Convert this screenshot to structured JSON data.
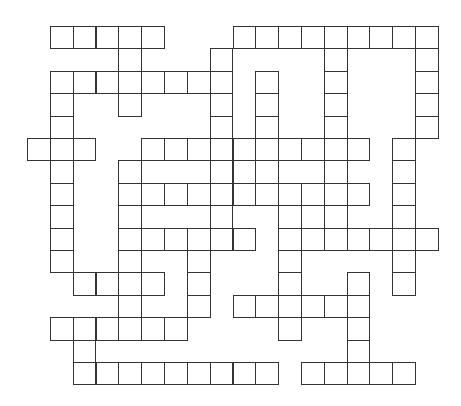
{
  "puzzle": {
    "type": "crossword-grid",
    "origin_x": 27,
    "origin_y": 26,
    "cell_w": 22.83,
    "cell_h": 22.4,
    "columns": 18,
    "rows": 16,
    "line_color": "#333333",
    "cell_color": "#ffffff",
    "cells_by_row": [
      [
        1,
        2,
        3,
        4,
        5,
        9,
        10,
        11,
        12,
        13,
        14,
        15,
        16,
        17
      ],
      [
        4,
        8,
        13,
        17
      ],
      [
        1,
        2,
        3,
        4,
        5,
        6,
        7,
        8,
        10,
        13,
        17
      ],
      [
        1,
        4,
        8,
        10,
        13,
        17
      ],
      [
        1,
        8,
        10,
        13,
        17
      ],
      [
        0,
        1,
        2,
        5,
        6,
        7,
        8,
        9,
        10,
        11,
        12,
        13,
        14,
        16
      ],
      [
        1,
        4,
        8,
        9,
        10,
        13,
        16
      ],
      [
        1,
        4,
        5,
        6,
        7,
        8,
        9,
        10,
        11,
        12,
        13,
        14,
        16
      ],
      [
        1,
        4,
        8,
        11,
        12,
        13,
        16
      ],
      [
        1,
        4,
        5,
        6,
        7,
        8,
        9,
        11,
        12,
        13,
        14,
        15,
        16,
        17
      ],
      [
        1,
        4,
        7,
        11,
        16
      ],
      [
        2,
        3,
        4,
        5,
        7,
        11,
        14,
        16
      ],
      [
        4,
        7,
        9,
        10,
        11,
        12,
        13,
        14
      ],
      [
        1,
        2,
        3,
        4,
        5,
        6,
        11,
        14
      ],
      [
        2,
        14
      ],
      [
        2,
        3,
        4,
        5,
        6,
        7,
        8,
        9,
        10,
        12,
        13,
        14,
        15,
        16
      ]
    ]
  }
}
